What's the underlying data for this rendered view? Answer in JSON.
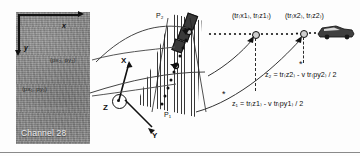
{
  "figure": {
    "domain": "diagram",
    "caption_absent": true,
    "background_color": "#fdfdfd",
    "border_color": "#8a8a8a"
  },
  "radar_panel": {
    "name": "Channel 28",
    "label": "Channel 28",
    "fill_color": "#8c8c8c",
    "axes": {
      "x_label": "x",
      "y_label": "y"
    },
    "pixel_markers": [
      {
        "id": "p2",
        "label": "(px₂, py₂)"
      },
      {
        "id": "p1",
        "label": "(px₁, py₁)"
      }
    ]
  },
  "coordinate_system": {
    "x_label": "X",
    "y_label": "Y",
    "z_label": "Z",
    "z_out_of_plane": true
  },
  "beam_fan": {
    "top_label": "P₂",
    "bottom_label": "P₁"
  },
  "trajectory": {
    "points": [
      {
        "id": "tr1",
        "label": "(tr₍x1₎, tr₍z1₎)"
      },
      {
        "id": "tr2",
        "label": "(tr₍x2₎, tr₍z2₎)"
      }
    ]
  },
  "equations": {
    "z2": "z₂ = tr₍z2₎ - v tr₍py2₎ / 2",
    "z1": "z₁ = tr₍z1₎ - v tr₍py1₎ / 2"
  },
  "vehicle": {
    "icon": "car-icon"
  },
  "markers": {
    "asterisk": "*"
  }
}
